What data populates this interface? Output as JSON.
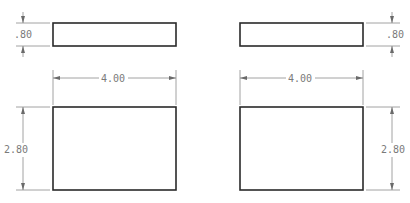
{
  "drawing": {
    "views": [
      {
        "name": "top-left-thin-view",
        "rect": {
          "x": 53,
          "y": 23,
          "w": 123,
          "h": 23
        },
        "dim_vertical": {
          "label": ".80",
          "line_x": 23,
          "text_x": 13,
          "text_y": 38
        }
      },
      {
        "name": "top-right-thin-view",
        "rect": {
          "x": 240,
          "y": 23,
          "w": 123,
          "h": 23
        },
        "dim_vertical": {
          "label": ".80",
          "line_x": 392,
          "text_x": 388,
          "text_y": 38
        }
      },
      {
        "name": "bottom-left-view",
        "rect": {
          "x": 53,
          "y": 107,
          "w": 123,
          "h": 83
        },
        "dim_horizontal": {
          "label": "4.00",
          "line_y": 78
        },
        "dim_vertical": {
          "label": "2.80",
          "line_x": 23,
          "text_x": 3,
          "text_y": 152
        }
      },
      {
        "name": "bottom-right-view",
        "rect": {
          "x": 240,
          "y": 107,
          "w": 123,
          "h": 83
        },
        "dim_horizontal": {
          "label": "4.00",
          "line_y": 78
        },
        "dim_vertical": {
          "label": "2.80",
          "line_x": 392,
          "text_x": 380,
          "text_y": 152
        }
      }
    ],
    "labels": {
      "thin_height": ".80",
      "width": "4.00",
      "height": "2.80"
    },
    "colors": {
      "part_outline": "#2a2a2a",
      "dimension_line": "#8a8a8a",
      "dimension_text": "#7a7a7a"
    }
  }
}
